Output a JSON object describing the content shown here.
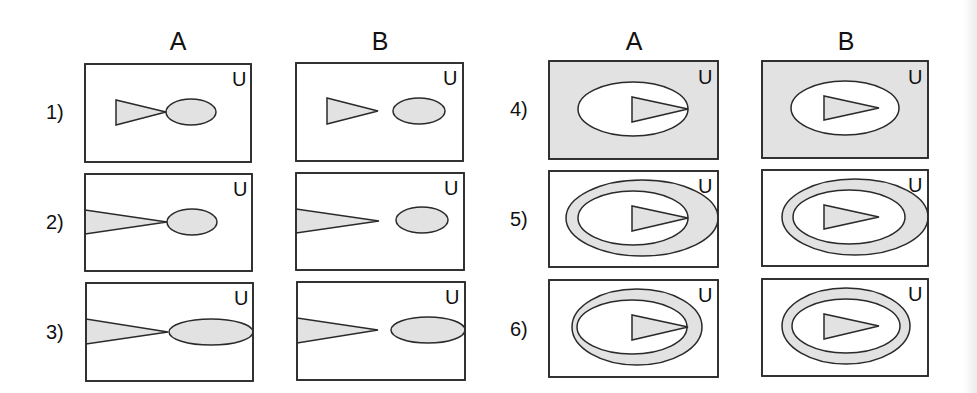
{
  "colors": {
    "shade": "#e2e2e2",
    "blank": "#ffffff",
    "stroke": "#2a2a2a"
  },
  "groups": [
    {
      "headers": [
        {
          "label": "A",
          "x": 178
        },
        {
          "label": "B",
          "x": 380
        }
      ]
    },
    {
      "headers": [
        {
          "label": "A",
          "x": 634
        },
        {
          "label": "B",
          "x": 846
        }
      ]
    }
  ],
  "header_y": 50,
  "universe_label": "U",
  "rows": [
    {
      "label": "1)",
      "label_x": 46,
      "label_y": 119
    },
    {
      "label": "2)",
      "label_x": 46,
      "label_y": 229
    },
    {
      "label": "3)",
      "label_x": 46,
      "label_y": 339
    },
    {
      "label": "4)",
      "label_x": 510,
      "label_y": 116
    },
    {
      "label": "5)",
      "label_x": 510,
      "label_y": 226
    },
    {
      "label": "6)",
      "label_x": 510,
      "label_y": 336
    }
  ],
  "panels": [
    {
      "id": "1A",
      "row": "1)",
      "column": "A",
      "frame": {
        "x": 85,
        "y": 64,
        "w": 166,
        "h": 98,
        "fill": "#ffffff"
      },
      "u": {
        "x": 232,
        "y": 86
      },
      "triangle": {
        "points": "116,100 116,125 166,112",
        "fill": "#e2e2e2"
      },
      "ellipses": [
        {
          "cx": 191,
          "cy": 112,
          "rx": 25,
          "ry": 13,
          "fill": "#e2e2e2"
        }
      ]
    },
    {
      "id": "1B",
      "row": "1)",
      "column": "B",
      "frame": {
        "x": 296,
        "y": 63,
        "w": 167,
        "h": 98,
        "fill": "#ffffff"
      },
      "u": {
        "x": 443,
        "y": 85
      },
      "triangle": {
        "points": "327,98 327,124 378,111",
        "fill": "#e2e2e2"
      },
      "ellipses": [
        {
          "cx": 419,
          "cy": 111,
          "rx": 26,
          "ry": 13,
          "fill": "#e2e2e2"
        }
      ]
    },
    {
      "id": "2A",
      "row": "2)",
      "column": "A",
      "frame": {
        "x": 85,
        "y": 174,
        "w": 167,
        "h": 97,
        "fill": "#ffffff"
      },
      "u": {
        "x": 233,
        "y": 196
      },
      "triangle": {
        "points": "85,210 85,234 167,222",
        "fill": "#e2e2e2"
      },
      "ellipses": [
        {
          "cx": 192,
          "cy": 222,
          "rx": 25,
          "ry": 13,
          "fill": "#e2e2e2"
        }
      ]
    },
    {
      "id": "2B",
      "row": "2)",
      "column": "B",
      "frame": {
        "x": 296,
        "y": 173,
        "w": 168,
        "h": 97,
        "fill": "#ffffff"
      },
      "u": {
        "x": 444,
        "y": 195
      },
      "triangle": {
        "points": "296,209 296,233 379,221",
        "fill": "#e2e2e2"
      },
      "ellipses": [
        {
          "cx": 422,
          "cy": 220,
          "rx": 26,
          "ry": 13,
          "fill": "#e2e2e2"
        }
      ]
    },
    {
      "id": "3A",
      "row": "3)",
      "column": "A",
      "frame": {
        "x": 86,
        "y": 283,
        "w": 167,
        "h": 98,
        "fill": "#ffffff"
      },
      "u": {
        "x": 234,
        "y": 305
      },
      "triangle": {
        "points": "86,319 86,344 168,332",
        "fill": "#e2e2e2"
      },
      "ellipses": [
        {
          "cx": 211,
          "cy": 332,
          "rx": 42,
          "ry": 13,
          "fill": "#e2e2e2"
        }
      ]
    },
    {
      "id": "3B",
      "row": "3)",
      "column": "B",
      "frame": {
        "x": 297,
        "y": 282,
        "w": 168,
        "h": 98,
        "fill": "#ffffff"
      },
      "u": {
        "x": 445,
        "y": 304
      },
      "triangle": {
        "points": "297,318 297,343 378,330",
        "fill": "#e2e2e2"
      },
      "ellipses": [
        {
          "cx": 428,
          "cy": 330,
          "rx": 37,
          "ry": 13,
          "fill": "#e2e2e2"
        }
      ]
    },
    {
      "id": "4A",
      "row": "4)",
      "column": "A",
      "frame": {
        "x": 549,
        "y": 61,
        "w": 169,
        "h": 98,
        "fill": "#e2e2e2"
      },
      "u": {
        "x": 698,
        "y": 84
      },
      "triangle": {
        "points": "632,97 632,122 688,109",
        "fill": "#e2e2e2"
      },
      "ellipses": [
        {
          "cx": 633,
          "cy": 109,
          "rx": 55,
          "ry": 27,
          "fill": "#ffffff"
        }
      ]
    },
    {
      "id": "4B",
      "row": "4)",
      "column": "B",
      "frame": {
        "x": 762,
        "y": 61,
        "w": 166,
        "h": 97,
        "fill": "#e2e2e2"
      },
      "u": {
        "x": 908,
        "y": 84
      },
      "triangle": {
        "points": "824,96 824,120 879,108",
        "fill": "#e2e2e2"
      },
      "ellipses": [
        {
          "cx": 845,
          "cy": 108,
          "rx": 54,
          "ry": 27,
          "fill": "#ffffff"
        }
      ]
    },
    {
      "id": "5A",
      "row": "5)",
      "column": "A",
      "frame": {
        "x": 549,
        "y": 171,
        "w": 169,
        "h": 96,
        "fill": "#ffffff"
      },
      "u": {
        "x": 698,
        "y": 193
      },
      "triangle": {
        "points": "632,206 632,231 688,218",
        "fill": "#e2e2e2"
      },
      "ellipses": [
        {
          "cx": 642,
          "cy": 218,
          "rx": 76,
          "ry": 38,
          "fill": "#e2e2e2"
        },
        {
          "cx": 633,
          "cy": 218,
          "rx": 55,
          "ry": 27,
          "fill": "#ffffff"
        }
      ]
    },
    {
      "id": "5B",
      "row": "5)",
      "column": "B",
      "frame": {
        "x": 762,
        "y": 170,
        "w": 166,
        "h": 96,
        "fill": "#ffffff"
      },
      "u": {
        "x": 908,
        "y": 192
      },
      "triangle": {
        "points": "824,205 824,229 879,217",
        "fill": "#e2e2e2"
      },
      "ellipses": [
        {
          "cx": 855,
          "cy": 217,
          "rx": 73,
          "ry": 38,
          "fill": "#e2e2e2"
        },
        {
          "cx": 849,
          "cy": 217,
          "rx": 56,
          "ry": 27,
          "fill": "#ffffff"
        }
      ]
    },
    {
      "id": "6A",
      "row": "6)",
      "column": "A",
      "frame": {
        "x": 549,
        "y": 280,
        "w": 169,
        "h": 97,
        "fill": "#ffffff"
      },
      "u": {
        "x": 698,
        "y": 302
      },
      "triangle": {
        "points": "632,315 632,340 688,327",
        "fill": "#e2e2e2"
      },
      "ellipses": [
        {
          "cx": 637,
          "cy": 327,
          "rx": 65,
          "ry": 38,
          "fill": "#e2e2e2"
        },
        {
          "cx": 632,
          "cy": 327,
          "rx": 55,
          "ry": 27,
          "fill": "#ffffff"
        }
      ]
    },
    {
      "id": "6B",
      "row": "6)",
      "column": "B",
      "frame": {
        "x": 762,
        "y": 279,
        "w": 166,
        "h": 97,
        "fill": "#ffffff"
      },
      "u": {
        "x": 908,
        "y": 301
      },
      "triangle": {
        "points": "824,314 824,339 879,326",
        "fill": "#e2e2e2"
      },
      "ellipses": [
        {
          "cx": 846,
          "cy": 326,
          "rx": 64,
          "ry": 38,
          "fill": "#e2e2e2"
        },
        {
          "cx": 846,
          "cy": 326,
          "rx": 54,
          "ry": 27,
          "fill": "#ffffff"
        }
      ]
    }
  ]
}
